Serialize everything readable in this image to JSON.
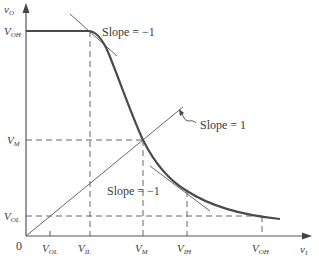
{
  "diagram": {
    "axes": {
      "x_label": {
        "main": "v",
        "sub": "I"
      },
      "y_label": {
        "main": "v",
        "sub": "O"
      },
      "origin": "0"
    },
    "y_ticks": [
      {
        "main": "V",
        "sub": "OH"
      },
      {
        "main": "V",
        "sub": "M"
      },
      {
        "main": "V",
        "sub": "OL"
      }
    ],
    "x_ticks": [
      {
        "main": "V",
        "sub": "OL"
      },
      {
        "main": "V",
        "sub": "IL"
      },
      {
        "main": "V",
        "sub": "M"
      },
      {
        "main": "V",
        "sub": "IH"
      },
      {
        "main": "V",
        "sub": "OH"
      }
    ],
    "annotations": {
      "slope_top": "Slope = −1",
      "slope_unity": "Slope = 1",
      "slope_bottom": "Slope = −1"
    },
    "colors": {
      "curve": "#4a4a4a",
      "lines": "#555555",
      "text": "#3a3a3a"
    }
  }
}
